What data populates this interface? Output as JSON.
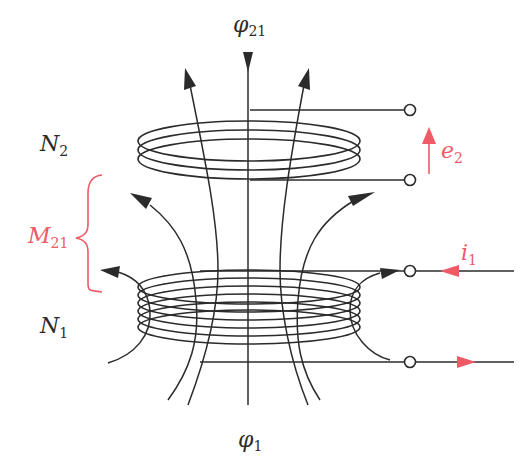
{
  "diagram": {
    "type": "mutual-inductance-coupled-coils",
    "colors": {
      "line": "#2b2b2b",
      "accent": "#ee5a66",
      "background": "#ffffff"
    },
    "labels": {
      "phi21": {
        "base": "φ",
        "sub": "21"
      },
      "phi1": {
        "base": "φ",
        "sub": "1"
      },
      "N2": {
        "base": "N",
        "sub": "2"
      },
      "N1": {
        "base": "N",
        "sub": "1"
      },
      "M21": {
        "base": "M",
        "sub": "21"
      },
      "e2": {
        "base": "e",
        "sub": "2"
      },
      "i1": {
        "base": "i",
        "sub": "1"
      }
    },
    "coils": [
      {
        "name": "secondary-coil",
        "turns_drawn": 3
      },
      {
        "name": "primary-coil",
        "turns_drawn": 6
      }
    ]
  }
}
